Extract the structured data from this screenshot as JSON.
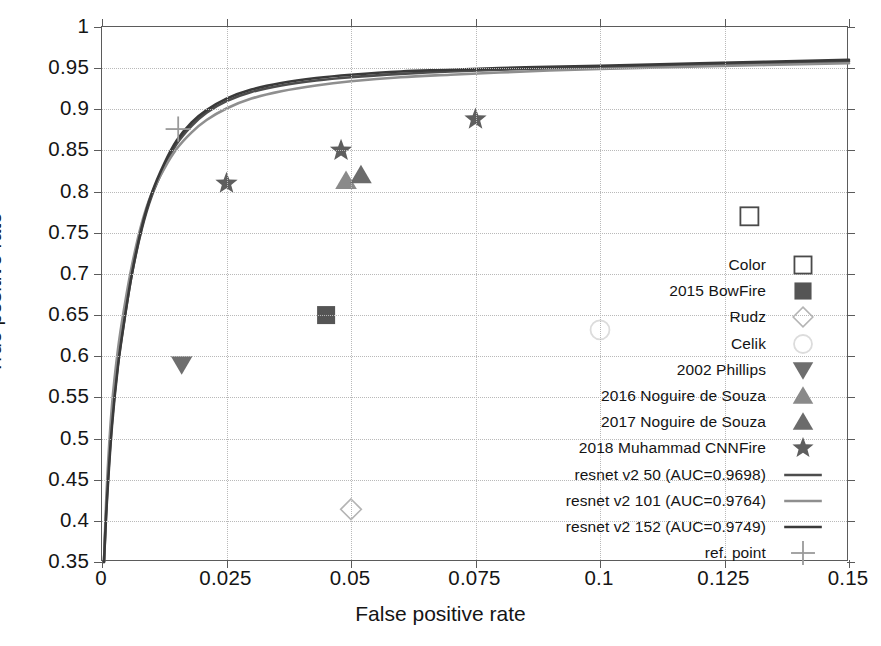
{
  "chart_data": {
    "type": "scatter",
    "title": "",
    "xlabel": "False positive rate",
    "ylabel": "True positive rate",
    "xlim": [
      0,
      0.15
    ],
    "ylim": [
      0.35,
      1
    ],
    "grid": true,
    "legend_position": "center-right",
    "xticks": [
      "0",
      "0.025",
      "0.05",
      "0.075",
      "0.1",
      "0.125",
      "0.15"
    ],
    "xtick_values": [
      0,
      0.025,
      0.05,
      0.075,
      0.1,
      0.125,
      0.15
    ],
    "yticks": [
      "0.35",
      "0.4",
      "0.45",
      "0.5",
      "0.55",
      "0.6",
      "0.65",
      "0.7",
      "0.75",
      "0.8",
      "0.85",
      "0.9",
      "0.95",
      "1"
    ],
    "ytick_values": [
      0.35,
      0.4,
      0.45,
      0.5,
      0.55,
      0.6,
      0.65,
      0.7,
      0.75,
      0.8,
      0.85,
      0.9,
      0.95,
      1
    ],
    "points": [
      {
        "name": "Color",
        "marker": "open-square",
        "x": 0.13,
        "y": 0.77,
        "color": "#4a4a4a"
      },
      {
        "name": "2015 BowFire",
        "marker": "filled-square",
        "x": 0.045,
        "y": 0.65,
        "color": "#555555"
      },
      {
        "name": "Rudz",
        "marker": "open-diamond",
        "x": 0.05,
        "y": 0.414,
        "color": "#b4b4b4"
      },
      {
        "name": "Celik",
        "marker": "open-circle",
        "x": 0.1,
        "y": 0.632,
        "color": "#dcdcdc"
      },
      {
        "name": "2002 Phillips",
        "marker": "down-triangle",
        "x": 0.016,
        "y": 0.59,
        "color": "#6e6e6e"
      },
      {
        "name": "2016 Noguire de Souza",
        "marker": "up-triangle",
        "x": 0.049,
        "y": 0.813,
        "color": "#8a8a8a"
      },
      {
        "name": "2017 Noguire de Souza",
        "marker": "up-triangle",
        "x": 0.052,
        "y": 0.82,
        "color": "#6b6b6b"
      },
      {
        "name": "2018 Muhammad CNNFire a",
        "marker": "star",
        "x": 0.025,
        "y": 0.81,
        "color": "#5e5e5e"
      },
      {
        "name": "2018 Muhammad CNNFire b",
        "marker": "star",
        "x": 0.048,
        "y": 0.85,
        "color": "#5e5e5e"
      },
      {
        "name": "2018 Muhammad CNNFire c",
        "marker": "star",
        "x": 0.075,
        "y": 0.888,
        "color": "#5e5e5e"
      },
      {
        "name": "ref. point",
        "marker": "cross",
        "x": 0.0153,
        "y": 0.876,
        "color": "#9a9a9a"
      }
    ],
    "series": [
      {
        "name": "resnet v2 50 (AUC=0.9698)",
        "auc": 0.9698,
        "color": "#4d4d4d",
        "width": 2.6,
        "x": [
          0.0004,
          0.001,
          0.002,
          0.0032,
          0.0045,
          0.006,
          0.008,
          0.01,
          0.0125,
          0.015,
          0.018,
          0.021,
          0.025,
          0.03,
          0.036,
          0.043,
          0.05,
          0.06,
          0.07,
          0.085,
          0.1,
          0.12,
          0.15
        ],
        "y": [
          0.35,
          0.43,
          0.52,
          0.59,
          0.645,
          0.7,
          0.755,
          0.795,
          0.83,
          0.858,
          0.88,
          0.896,
          0.91,
          0.921,
          0.929,
          0.935,
          0.939,
          0.943,
          0.946,
          0.949,
          0.951,
          0.954,
          0.958
        ]
      },
      {
        "name": "resnet v2 101 (AUC=0.9764)",
        "auc": 0.9764,
        "color": "#8f8f8f",
        "width": 2.6,
        "x": [
          0.0004,
          0.001,
          0.002,
          0.0032,
          0.0045,
          0.006,
          0.008,
          0.01,
          0.0125,
          0.015,
          0.018,
          0.021,
          0.025,
          0.03,
          0.036,
          0.043,
          0.05,
          0.06,
          0.07,
          0.085,
          0.1,
          0.12,
          0.15
        ],
        "y": [
          0.35,
          0.445,
          0.54,
          0.608,
          0.66,
          0.71,
          0.762,
          0.798,
          0.828,
          0.852,
          0.872,
          0.887,
          0.901,
          0.913,
          0.922,
          0.929,
          0.934,
          0.939,
          0.942,
          0.946,
          0.949,
          0.952,
          0.956
        ]
      },
      {
        "name": "resnet v2 152 (AUC=0.9749)",
        "auc": 0.9749,
        "color": "#3a3a3a",
        "width": 2.6,
        "x": [
          0.0004,
          0.001,
          0.002,
          0.0032,
          0.0045,
          0.006,
          0.008,
          0.01,
          0.0125,
          0.015,
          0.018,
          0.021,
          0.025,
          0.03,
          0.036,
          0.043,
          0.05,
          0.06,
          0.07,
          0.085,
          0.1,
          0.12,
          0.15
        ],
        "y": [
          0.35,
          0.425,
          0.515,
          0.588,
          0.644,
          0.7,
          0.757,
          0.798,
          0.834,
          0.862,
          0.884,
          0.899,
          0.913,
          0.924,
          0.932,
          0.938,
          0.942,
          0.946,
          0.948,
          0.951,
          0.953,
          0.956,
          0.96
        ]
      }
    ]
  },
  "axes": {
    "x_title": "False positive rate",
    "y_title": "True positive rate"
  },
  "legend": {
    "items": [
      {
        "label": "Color",
        "key": "open-square"
      },
      {
        "label": "2015 BowFire",
        "key": "filled-square"
      },
      {
        "label": "Rudz",
        "key": "open-diamond"
      },
      {
        "label": "Celik",
        "key": "open-circle"
      },
      {
        "label": "2002 Phillips",
        "key": "down-triangle"
      },
      {
        "label": "2016 Noguire de Souza",
        "key": "up-triangle-light"
      },
      {
        "label": "2017 Noguire de Souza",
        "key": "up-triangle-dark"
      },
      {
        "label": "2018 Muhammad CNNFire",
        "key": "star"
      },
      {
        "label": "resnet v2 50 (AUC=0.9698)",
        "key": "line-dark"
      },
      {
        "label": "resnet v2 101 (AUC=0.9764)",
        "key": "line-mid"
      },
      {
        "label": "resnet v2 152 (AUC=0.9749)",
        "key": "line-darkest"
      },
      {
        "label": "ref. point",
        "key": "cross"
      }
    ]
  },
  "colors": {
    "frame": "#5b5b5b",
    "grid": "#b9b9b9",
    "text": "#151515",
    "resnet50": "#4d4d4d",
    "resnet101": "#8f8f8f",
    "resnet152": "#3a3a3a"
  }
}
